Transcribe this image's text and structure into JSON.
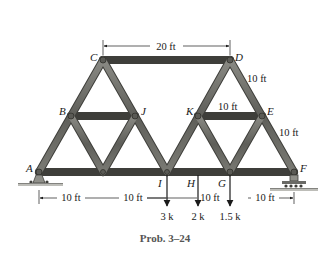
{
  "figure": {
    "caption": "Prob. 3–24",
    "nodes": [
      {
        "id": "A",
        "label": "A"
      },
      {
        "id": "B",
        "label": "B"
      },
      {
        "id": "C",
        "label": "C"
      },
      {
        "id": "D",
        "label": "D"
      },
      {
        "id": "E",
        "label": "E"
      },
      {
        "id": "F",
        "label": "F"
      },
      {
        "id": "G",
        "label": "G"
      },
      {
        "id": "H",
        "label": "H"
      },
      {
        "id": "I",
        "label": "I"
      },
      {
        "id": "J",
        "label": "J"
      },
      {
        "id": "K",
        "label": "K"
      }
    ],
    "dimensions": {
      "top_span": "20 ft",
      "cd_to_de": "10 ft",
      "ke": "10 ft",
      "ef": "10 ft",
      "ai": "10 ft",
      "ih": "10 ft",
      "hg": "10 ft",
      "gf": "10 ft"
    },
    "loads": [
      {
        "at": "I",
        "value": "3 k"
      },
      {
        "at": "H",
        "value": "2 k"
      },
      {
        "at": "G",
        "value": "1.5 k"
      }
    ],
    "supports": {
      "A": "pin",
      "F": "roller"
    },
    "colors": {
      "member": "#6b6b66",
      "member_edge": "#3e3e3a",
      "ground": "#bdbdb8",
      "text": "#1a1a1a"
    }
  }
}
